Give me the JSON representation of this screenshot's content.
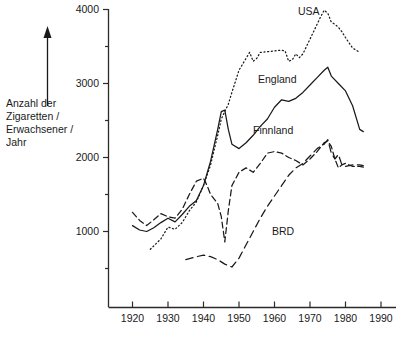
{
  "chart_data": {
    "type": "line",
    "title": "",
    "xlabel": "",
    "ylabel": "Anzahl der Zigaretten / Erwachsener / Jahr",
    "ylabel_lines": [
      "Anzahl der",
      "Zigaretten /",
      "Erwachsener /",
      "Jahr"
    ],
    "xlim": [
      1915,
      1992
    ],
    "ylim": [
      0,
      4150
    ],
    "grid": false,
    "legend_position": "inline-annotations",
    "xticks": [
      1920,
      1930,
      1940,
      1950,
      1960,
      1970,
      1980,
      1990
    ],
    "xtick_labels": [
      "1920",
      "1930",
      "1940",
      "1950",
      "1960",
      "1970",
      "1980",
      "1990"
    ],
    "yticks": [
      1000,
      2000,
      3000,
      4000
    ],
    "ytick_labels": [
      "1000",
      "2000",
      "3000",
      "4000"
    ],
    "yticks_minor": [
      500,
      1500,
      2500,
      3500
    ],
    "series": [
      {
        "name": "USA",
        "style": "dotted",
        "label_position": {
          "x": 1975,
          "y": 4000
        },
        "points": [
          [
            1925,
            760
          ],
          [
            1928,
            900
          ],
          [
            1930,
            1060
          ],
          [
            1932,
            1030
          ],
          [
            1934,
            1120
          ],
          [
            1936,
            1280
          ],
          [
            1938,
            1400
          ],
          [
            1940,
            1620
          ],
          [
            1942,
            1900
          ],
          [
            1944,
            2300
          ],
          [
            1945,
            2520
          ],
          [
            1946,
            2620
          ],
          [
            1947,
            2720
          ],
          [
            1948,
            2880
          ],
          [
            1950,
            3180
          ],
          [
            1952,
            3340
          ],
          [
            1953,
            3420
          ],
          [
            1954,
            3300
          ],
          [
            1955,
            3340
          ],
          [
            1956,
            3420
          ],
          [
            1958,
            3430
          ],
          [
            1960,
            3440
          ],
          [
            1962,
            3450
          ],
          [
            1963,
            3440
          ],
          [
            1964,
            3300
          ],
          [
            1965,
            3320
          ],
          [
            1966,
            3400
          ],
          [
            1967,
            3350
          ],
          [
            1968,
            3400
          ],
          [
            1970,
            3600
          ],
          [
            1972,
            3800
          ],
          [
            1973,
            3900
          ],
          [
            1974,
            3990
          ],
          [
            1975,
            3950
          ],
          [
            1976,
            3830
          ],
          [
            1977,
            3800
          ],
          [
            1978,
            3760
          ],
          [
            1979,
            3700
          ],
          [
            1980,
            3620
          ],
          [
            1982,
            3480
          ],
          [
            1984,
            3420
          ]
        ]
      },
      {
        "name": "England",
        "style": "solid",
        "label_position": {
          "x": 1962,
          "y": 3080
        },
        "points": [
          [
            1920,
            1080
          ],
          [
            1922,
            1020
          ],
          [
            1924,
            1000
          ],
          [
            1926,
            1050
          ],
          [
            1928,
            1120
          ],
          [
            1930,
            1180
          ],
          [
            1932,
            1130
          ],
          [
            1934,
            1230
          ],
          [
            1936,
            1340
          ],
          [
            1938,
            1420
          ],
          [
            1940,
            1620
          ],
          [
            1942,
            1950
          ],
          [
            1944,
            2380
          ],
          [
            1945,
            2620
          ],
          [
            1946,
            2640
          ],
          [
            1947,
            2380
          ],
          [
            1948,
            2180
          ],
          [
            1950,
            2120
          ],
          [
            1952,
            2200
          ],
          [
            1954,
            2300
          ],
          [
            1956,
            2420
          ],
          [
            1958,
            2520
          ],
          [
            1960,
            2680
          ],
          [
            1962,
            2780
          ],
          [
            1964,
            2760
          ],
          [
            1966,
            2800
          ],
          [
            1968,
            2880
          ],
          [
            1970,
            2980
          ],
          [
            1972,
            3080
          ],
          [
            1974,
            3180
          ],
          [
            1975,
            3220
          ],
          [
            1976,
            3100
          ],
          [
            1978,
            3000
          ],
          [
            1980,
            2900
          ],
          [
            1982,
            2700
          ],
          [
            1984,
            2380
          ],
          [
            1985,
            2350
          ]
        ]
      },
      {
        "name": "Finnland",
        "style": "dashed",
        "label_position": {
          "x": 1954,
          "y": 2430
        },
        "points": [
          [
            1920,
            1260
          ],
          [
            1922,
            1150
          ],
          [
            1924,
            1080
          ],
          [
            1926,
            1160
          ],
          [
            1928,
            1240
          ],
          [
            1930,
            1200
          ],
          [
            1932,
            1180
          ],
          [
            1934,
            1300
          ],
          [
            1936,
            1500
          ],
          [
            1938,
            1680
          ],
          [
            1940,
            1720
          ],
          [
            1941,
            1620
          ],
          [
            1942,
            1500
          ],
          [
            1944,
            1380
          ],
          [
            1945,
            1200
          ],
          [
            1946,
            860
          ],
          [
            1947,
            1280
          ],
          [
            1948,
            1620
          ],
          [
            1950,
            1800
          ],
          [
            1952,
            1860
          ],
          [
            1954,
            1800
          ],
          [
            1956,
            1920
          ],
          [
            1958,
            2060
          ],
          [
            1960,
            2080
          ],
          [
            1962,
            2060
          ],
          [
            1964,
            2000
          ],
          [
            1966,
            1960
          ],
          [
            1968,
            1900
          ],
          [
            1970,
            1980
          ],
          [
            1972,
            2080
          ],
          [
            1974,
            2200
          ],
          [
            1975,
            2220
          ],
          [
            1976,
            2150
          ],
          [
            1977,
            1980
          ],
          [
            1978,
            1860
          ],
          [
            1979,
            1900
          ],
          [
            1980,
            1920
          ],
          [
            1982,
            1880
          ],
          [
            1984,
            1880
          ],
          [
            1985,
            1870
          ]
        ]
      },
      {
        "name": "BRD",
        "style": "long-dashed",
        "label_position": {
          "x": 1960,
          "y": 1030
        },
        "points": [
          [
            1935,
            620
          ],
          [
            1938,
            660
          ],
          [
            1940,
            680
          ],
          [
            1942,
            660
          ],
          [
            1944,
            620
          ],
          [
            1946,
            560
          ],
          [
            1948,
            520
          ],
          [
            1950,
            640
          ],
          [
            1952,
            820
          ],
          [
            1954,
            1000
          ],
          [
            1956,
            1180
          ],
          [
            1958,
            1340
          ],
          [
            1960,
            1480
          ],
          [
            1962,
            1620
          ],
          [
            1964,
            1760
          ],
          [
            1966,
            1860
          ],
          [
            1968,
            1920
          ],
          [
            1970,
            2020
          ],
          [
            1972,
            2120
          ],
          [
            1974,
            2180
          ],
          [
            1975,
            2240
          ],
          [
            1976,
            2060
          ],
          [
            1977,
            1980
          ],
          [
            1978,
            2040
          ],
          [
            1979,
            1900
          ],
          [
            1980,
            1880
          ],
          [
            1982,
            1900
          ],
          [
            1984,
            1900
          ],
          [
            1985,
            1890
          ]
        ]
      }
    ]
  },
  "annotations": {
    "usa": "USA",
    "england": "England",
    "finnland": "Finnland",
    "brd": "BRD"
  },
  "ylabel_block": {
    "line1": "Anzahl der",
    "line2": "Zigaretten /",
    "line3": "Erwachsener /",
    "line4": "Jahr"
  },
  "axis": {
    "ytick_4000": "4000",
    "ytick_3000": "3000",
    "ytick_2000": "2000",
    "ytick_1000": "1000",
    "xtick_1920": "1920",
    "xtick_1930": "1930",
    "xtick_1940": "1940",
    "xtick_1950": "1950",
    "xtick_1960": "1960",
    "xtick_1970": "1970",
    "xtick_1980": "1980",
    "xtick_1990": "1990"
  }
}
